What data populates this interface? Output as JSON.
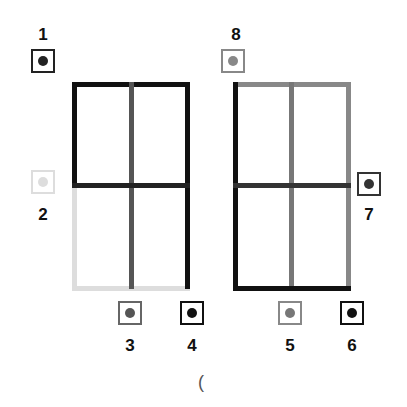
{
  "colors": {
    "black": "#111111",
    "dark_gray": "#444444",
    "mid_gray": "#666666",
    "gray": "#888888",
    "light_gray": "#dddddd"
  },
  "markers": [
    {
      "label": "1",
      "color": "#222222",
      "border": "#222222"
    },
    {
      "label": "2",
      "color": "#dddddd",
      "border": "#dddddd"
    },
    {
      "label": "3",
      "color": "#555555",
      "border": "#666666"
    },
    {
      "label": "4",
      "color": "#111111",
      "border": "#111111"
    },
    {
      "label": "5",
      "color": "#777777",
      "border": "#888888"
    },
    {
      "label": "6",
      "color": "#111111",
      "border": "#111111"
    },
    {
      "label": "7",
      "color": "#333333",
      "border": "#333333"
    },
    {
      "label": "8",
      "color": "#888888",
      "border": "#888888"
    }
  ],
  "footer": {
    "glyph": "("
  }
}
